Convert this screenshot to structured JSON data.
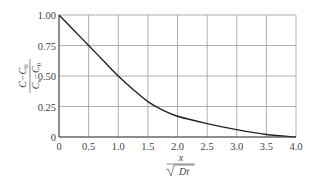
{
  "chart_data": {
    "type": "line",
    "title": "",
    "xlabel": "x / √(Dt)",
    "ylabel": "(C − C0) / (Cs − C0)",
    "xlim": [
      0,
      4.0
    ],
    "ylim": [
      0,
      1.0
    ],
    "grid": true,
    "legend": null,
    "x_ticks": [
      "0",
      "0.5",
      "1.0",
      "1.5",
      "2.0",
      "2.5",
      "3.0",
      "3.5",
      "4.0"
    ],
    "y_ticks": [
      "0",
      "0.25",
      "0.50",
      "0.75",
      "1.00"
    ],
    "series": [
      {
        "name": "concentration profile",
        "color": "#222222",
        "x": [
          0,
          0.25,
          0.5,
          0.75,
          1.0,
          1.25,
          1.5,
          1.75,
          2.0,
          2.5,
          3.0,
          3.5,
          4.0
        ],
        "y": [
          1.0,
          0.875,
          0.75,
          0.625,
          0.5,
          0.39,
          0.29,
          0.22,
          0.17,
          0.11,
          0.06,
          0.02,
          0.0
        ]
      }
    ]
  },
  "axis_labels": {
    "y_num": "C−C",
    "y_num_sub": "0",
    "y_den": "C",
    "y_den_sub1": "s",
    "y_den_mid": "−C",
    "y_den_sub2": "0",
    "x_num": "x",
    "x_den": "Dt"
  }
}
